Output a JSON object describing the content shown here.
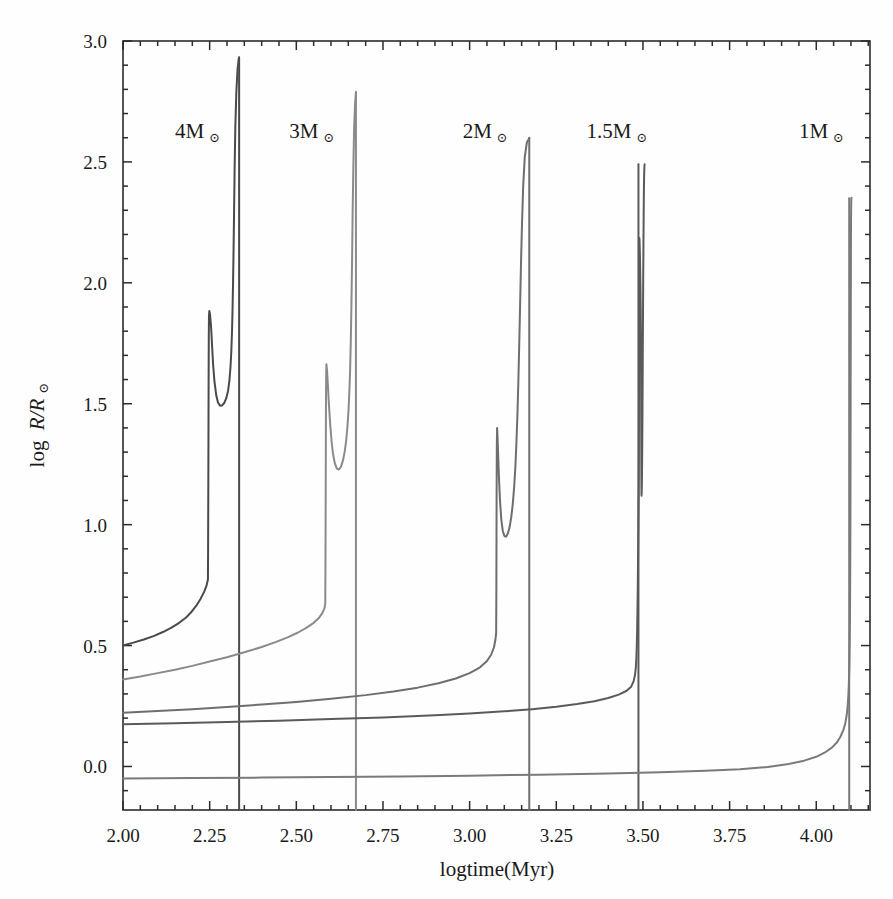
{
  "figure": {
    "background_color": "#fefefe",
    "axis_color": "#2b2b2b",
    "text_color": "#1a1a1a"
  },
  "axes": {
    "xlabel": "logtime(Myr)",
    "ylabel_parts": {
      "log": "log",
      "ratio": "R/R",
      "sun": "⊙"
    },
    "x_ticks": [
      "2.00",
      "2.25",
      "2.50",
      "2.75",
      "3.00",
      "3.25",
      "3.50",
      "3.75",
      "4.00"
    ],
    "y_ticks": [
      "0.0",
      "0.5",
      "1.0",
      "1.5",
      "2.0",
      "2.5",
      "3.0"
    ]
  },
  "annotations": [
    {
      "name": "label-4msun",
      "mass": "4M",
      "symbol": "⊙",
      "x": 2.215,
      "y": 2.6
    },
    {
      "name": "label-3msun",
      "mass": "3M",
      "symbol": "⊙",
      "x": 2.545,
      "y": 2.6
    },
    {
      "name": "label-2msun",
      "mass": "2M",
      "symbol": "⊙",
      "x": 3.045,
      "y": 2.6
    },
    {
      "name": "label-1.5msun",
      "mass": "1.5M",
      "symbol": "⊙",
      "x": 3.425,
      "y": 2.6
    },
    {
      "name": "label-1msun",
      "mass": "1M",
      "symbol": "⊙",
      "x": 4.015,
      "y": 2.6
    }
  ],
  "chart_data": {
    "type": "line",
    "title": "",
    "xlabel": "logtime(Myr)",
    "ylabel": "log R/R⊙",
    "xlim": [
      2.0,
      4.155
    ],
    "ylim": [
      -0.18,
      3.0
    ],
    "grid": false,
    "legend": "inline-annotations",
    "x_ticks": [
      2.0,
      2.25,
      2.5,
      2.75,
      3.0,
      3.25,
      3.5,
      3.75,
      4.0
    ],
    "y_ticks": [
      0.0,
      0.5,
      1.0,
      1.5,
      2.0,
      2.5,
      3.0
    ],
    "series": [
      {
        "name": "4M⊙",
        "color": "#4a4a4a",
        "width": 2.0,
        "terminal_logtime": 2.335,
        "peak_logR": 2.93,
        "points": [
          [
            2.0,
            0.5
          ],
          [
            2.03,
            0.512
          ],
          [
            2.06,
            0.525
          ],
          [
            2.09,
            0.54
          ],
          [
            2.115,
            0.556
          ],
          [
            2.14,
            0.574
          ],
          [
            2.162,
            0.594
          ],
          [
            2.182,
            0.616
          ],
          [
            2.198,
            0.64
          ],
          [
            2.212,
            0.666
          ],
          [
            2.224,
            0.694
          ],
          [
            2.234,
            0.722
          ],
          [
            2.241,
            0.748
          ],
          [
            2.245,
            0.773
          ],
          [
            2.2455,
            0.9
          ],
          [
            2.246,
            1.1
          ],
          [
            2.2465,
            1.35
          ],
          [
            2.247,
            1.6
          ],
          [
            2.2475,
            1.78
          ],
          [
            2.248,
            1.86
          ],
          [
            2.249,
            1.884
          ],
          [
            2.251,
            1.87
          ],
          [
            2.254,
            1.82
          ],
          [
            2.257,
            1.74
          ],
          [
            2.26,
            1.66
          ],
          [
            2.264,
            1.59
          ],
          [
            2.269,
            1.535
          ],
          [
            2.274,
            1.505
          ],
          [
            2.28,
            1.492
          ],
          [
            2.286,
            1.493
          ],
          [
            2.292,
            1.503
          ],
          [
            2.298,
            1.523
          ],
          [
            2.303,
            1.553
          ],
          [
            2.307,
            1.596
          ],
          [
            2.31,
            1.65
          ],
          [
            2.3125,
            1.718
          ],
          [
            2.3145,
            1.8
          ],
          [
            2.316,
            1.89
          ],
          [
            2.3175,
            2.0
          ],
          [
            2.319,
            2.14
          ],
          [
            2.3205,
            2.3
          ],
          [
            2.322,
            2.47
          ],
          [
            2.324,
            2.64
          ],
          [
            2.327,
            2.79
          ],
          [
            2.3305,
            2.885
          ],
          [
            2.334,
            2.928
          ],
          [
            2.335,
            2.933
          ]
        ]
      },
      {
        "name": "3M⊙",
        "color": "#8a8a8a",
        "width": 2.0,
        "terminal_logtime": 2.672,
        "peak_logR": 2.79,
        "points": [
          [
            2.0,
            0.36
          ],
          [
            2.05,
            0.372
          ],
          [
            2.1,
            0.386
          ],
          [
            2.15,
            0.4
          ],
          [
            2.2,
            0.416
          ],
          [
            2.25,
            0.434
          ],
          [
            2.3,
            0.452
          ],
          [
            2.35,
            0.472
          ],
          [
            2.4,
            0.494
          ],
          [
            2.44,
            0.514
          ],
          [
            2.475,
            0.534
          ],
          [
            2.505,
            0.554
          ],
          [
            2.53,
            0.574
          ],
          [
            2.55,
            0.594
          ],
          [
            2.565,
            0.614
          ],
          [
            2.575,
            0.634
          ],
          [
            2.581,
            0.654
          ],
          [
            2.5835,
            0.672
          ],
          [
            2.584,
            0.8
          ],
          [
            2.5845,
            1.0
          ],
          [
            2.585,
            1.25
          ],
          [
            2.5855,
            1.48
          ],
          [
            2.586,
            1.61
          ],
          [
            2.5868,
            1.663
          ],
          [
            2.5885,
            1.64
          ],
          [
            2.591,
            1.58
          ],
          [
            2.594,
            1.5
          ],
          [
            2.5975,
            1.42
          ],
          [
            2.6015,
            1.348
          ],
          [
            2.606,
            1.292
          ],
          [
            2.611,
            1.254
          ],
          [
            2.617,
            1.232
          ],
          [
            2.623,
            1.228
          ],
          [
            2.629,
            1.24
          ],
          [
            2.635,
            1.268
          ],
          [
            2.64,
            1.305
          ],
          [
            2.644,
            1.35
          ],
          [
            2.6475,
            1.405
          ],
          [
            2.6505,
            1.47
          ],
          [
            2.653,
            1.548
          ],
          [
            2.6552,
            1.64
          ],
          [
            2.6572,
            1.76
          ],
          [
            2.659,
            1.91
          ],
          [
            2.6608,
            2.09
          ],
          [
            2.6625,
            2.29
          ],
          [
            2.6645,
            2.48
          ],
          [
            2.6668,
            2.64
          ],
          [
            2.6695,
            2.74
          ],
          [
            2.672,
            2.785
          ]
        ]
      },
      {
        "name": "2M⊙",
        "color": "#6e6e6e",
        "width": 2.0,
        "terminal_logtime": 3.172,
        "peak_logR": 2.6,
        "points": [
          [
            2.0,
            0.222
          ],
          [
            2.1,
            0.229
          ],
          [
            2.2,
            0.237
          ],
          [
            2.3,
            0.246
          ],
          [
            2.4,
            0.256
          ],
          [
            2.5,
            0.267
          ],
          [
            2.6,
            0.28
          ],
          [
            2.7,
            0.295
          ],
          [
            2.78,
            0.31
          ],
          [
            2.85,
            0.326
          ],
          [
            2.91,
            0.344
          ],
          [
            2.96,
            0.364
          ],
          [
            3.0,
            0.386
          ],
          [
            3.03,
            0.41
          ],
          [
            3.05,
            0.436
          ],
          [
            3.062,
            0.462
          ],
          [
            3.07,
            0.492
          ],
          [
            3.0745,
            0.525
          ],
          [
            3.0765,
            0.552
          ],
          [
            3.077,
            0.7
          ],
          [
            3.0775,
            0.95
          ],
          [
            3.078,
            1.18
          ],
          [
            3.0785,
            1.33
          ],
          [
            3.0792,
            1.4
          ],
          [
            3.0805,
            1.365
          ],
          [
            3.0825,
            1.28
          ],
          [
            3.085,
            1.18
          ],
          [
            3.088,
            1.09
          ],
          [
            3.0915,
            1.02
          ],
          [
            3.0955,
            0.975
          ],
          [
            3.1,
            0.954
          ],
          [
            3.105,
            0.95
          ],
          [
            3.11,
            0.962
          ],
          [
            3.115,
            0.988
          ],
          [
            3.12,
            1.03
          ],
          [
            3.1245,
            1.086
          ],
          [
            3.1285,
            1.156
          ],
          [
            3.132,
            1.24
          ],
          [
            3.135,
            1.34
          ],
          [
            3.138,
            1.46
          ],
          [
            3.1405,
            1.59
          ],
          [
            3.143,
            1.74
          ],
          [
            3.1455,
            1.9
          ],
          [
            3.148,
            2.07
          ],
          [
            3.151,
            2.24
          ],
          [
            3.1545,
            2.4
          ],
          [
            3.159,
            2.52
          ],
          [
            3.165,
            2.58
          ],
          [
            3.172,
            2.598
          ]
        ]
      },
      {
        "name": "1.5M⊙",
        "color": "#5a5a5a",
        "width": 2.0,
        "terminal_logtime": 3.487,
        "peak_logR": 2.49,
        "points": [
          [
            2.0,
            0.175
          ],
          [
            2.15,
            0.179
          ],
          [
            2.3,
            0.184
          ],
          [
            2.45,
            0.189
          ],
          [
            2.6,
            0.196
          ],
          [
            2.75,
            0.203
          ],
          [
            2.9,
            0.212
          ],
          [
            3.0,
            0.219
          ],
          [
            3.1,
            0.228
          ],
          [
            3.18,
            0.237
          ],
          [
            3.25,
            0.247
          ],
          [
            3.31,
            0.258
          ],
          [
            3.36,
            0.27
          ],
          [
            3.4,
            0.283
          ],
          [
            3.43,
            0.297
          ],
          [
            3.452,
            0.312
          ],
          [
            3.466,
            0.33
          ],
          [
            3.473,
            0.352
          ],
          [
            3.477,
            0.378
          ],
          [
            3.4795,
            0.41
          ],
          [
            3.481,
            0.45
          ],
          [
            3.4822,
            0.5
          ],
          [
            3.4832,
            0.56
          ],
          [
            3.484,
            0.63
          ],
          [
            3.4848,
            0.71
          ],
          [
            3.4855,
            0.8
          ],
          [
            3.4862,
            0.9
          ],
          [
            3.4868,
            1.0
          ],
          [
            3.4873,
            1.08
          ],
          [
            3.4877,
            1.13
          ],
          [
            3.488,
            1.2
          ],
          [
            3.4883,
            1.32
          ],
          [
            3.4885,
            1.5
          ],
          [
            3.4887,
            1.7
          ],
          [
            3.4889,
            1.9
          ],
          [
            3.4891,
            2.06
          ],
          [
            3.4893,
            2.15
          ],
          [
            3.4896,
            2.185
          ],
          [
            3.4903,
            2.17
          ],
          [
            3.4912,
            2.12
          ],
          [
            3.492,
            2.06
          ],
          [
            3.4928,
            1.99
          ],
          [
            3.4935,
            1.9
          ],
          [
            3.494,
            1.8
          ],
          [
            3.4944,
            1.68
          ],
          [
            3.4947,
            1.54
          ],
          [
            3.495,
            1.39
          ],
          [
            3.4953,
            1.25
          ],
          [
            3.4956,
            1.15
          ],
          [
            3.496,
            1.12
          ],
          [
            3.4968,
            1.16
          ],
          [
            3.4976,
            1.26
          ],
          [
            3.4984,
            1.42
          ],
          [
            3.4992,
            1.62
          ],
          [
            3.5,
            1.83
          ],
          [
            3.5008,
            2.03
          ],
          [
            3.5016,
            2.2
          ],
          [
            3.5024,
            2.34
          ],
          [
            3.5032,
            2.43
          ],
          [
            3.504,
            2.475
          ],
          [
            3.5046,
            2.49
          ]
        ]
      },
      {
        "name": "1M⊙",
        "color": "#7a7a7a",
        "width": 2.0,
        "terminal_logtime": 4.095,
        "peak_logR": 2.35,
        "points": [
          [
            2.0,
            -0.05
          ],
          [
            2.2,
            -0.048
          ],
          [
            2.4,
            -0.046
          ],
          [
            2.6,
            -0.044
          ],
          [
            2.8,
            -0.041
          ],
          [
            3.0,
            -0.038
          ],
          [
            3.2,
            -0.034
          ],
          [
            3.4,
            -0.029
          ],
          [
            3.55,
            -0.024
          ],
          [
            3.68,
            -0.018
          ],
          [
            3.78,
            -0.011
          ],
          [
            3.86,
            -0.002
          ],
          [
            3.92,
            0.01
          ],
          [
            3.965,
            0.024
          ],
          [
            4.0,
            0.04
          ],
          [
            4.025,
            0.058
          ],
          [
            4.045,
            0.078
          ],
          [
            4.06,
            0.1
          ],
          [
            4.07,
            0.124
          ],
          [
            4.078,
            0.15
          ],
          [
            4.084,
            0.18
          ],
          [
            4.088,
            0.215
          ],
          [
            4.0908,
            0.255
          ],
          [
            4.0928,
            0.3
          ],
          [
            4.0942,
            0.35
          ],
          [
            4.0952,
            0.405
          ],
          [
            4.096,
            0.465
          ],
          [
            4.0966,
            0.53
          ],
          [
            4.0971,
            0.6
          ],
          [
            4.0975,
            0.68
          ],
          [
            4.0978,
            0.77
          ],
          [
            4.0981,
            0.87
          ],
          [
            4.0984,
            0.98
          ],
          [
            4.0986,
            1.1
          ],
          [
            4.0988,
            1.24
          ],
          [
            4.099,
            1.4
          ],
          [
            4.0992,
            1.57
          ],
          [
            4.0994,
            1.74
          ],
          [
            4.0996,
            1.9
          ],
          [
            4.0998,
            2.04
          ],
          [
            4.1,
            2.16
          ],
          [
            4.1003,
            2.26
          ],
          [
            4.1007,
            2.32
          ],
          [
            4.1012,
            2.348
          ],
          [
            4.1016,
            2.352
          ]
        ]
      }
    ]
  }
}
